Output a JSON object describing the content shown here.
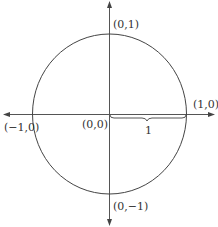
{
  "diagram": {
    "center": {
      "x": 109,
      "y": 114
    },
    "radius": 77,
    "labels": {
      "top": "(0,1)",
      "right": "(1,0)",
      "left": "(−1,0)",
      "origin": "(0,0)",
      "bottom": "(0,−1)",
      "radius": "1"
    },
    "colors": {
      "stroke": "#444444",
      "text": "#333333",
      "background": "#ffffff"
    }
  }
}
